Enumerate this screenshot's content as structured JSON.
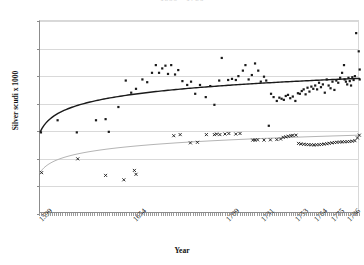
{
  "chart_data": {
    "type": "scatter",
    "title": "1599 - 1786",
    "xlabel": "Year",
    "ylabel": "Silver scudi x 1000",
    "ylim": [
      0,
      3500
    ],
    "ytick_labels": [
      "0",
      "500",
      "1,000",
      "1,500",
      "2,000",
      "2,500",
      "3,000",
      "3,500"
    ],
    "ytick_values": [
      0,
      500,
      1000,
      1500,
      2000,
      2500,
      3000,
      3500
    ],
    "xtick_labels": [
      "1599",
      "1654",
      "1709",
      "1731",
      "1753",
      "1764",
      "1775",
      "1786"
    ],
    "xtick_positions": [
      0,
      0.295,
      0.585,
      0.695,
      0.8,
      0.858,
      0.912,
      0.963
    ],
    "grid": "horizontal",
    "legend": "none",
    "series": [
      {
        "name": "upper-series",
        "marker": "square",
        "color": "#1a1a1a",
        "trend": "logarithmic",
        "trend_color": "#1a1a1a",
        "trend_start_value": 1480,
        "trend_end_value": 2460,
        "points": [
          [
            0.003,
            1480
          ],
          [
            0.055,
            1700
          ],
          [
            0.115,
            1480
          ],
          [
            0.175,
            1700
          ],
          [
            0.205,
            1720
          ],
          [
            0.215,
            1490
          ],
          [
            0.245,
            1940
          ],
          [
            0.268,
            2420
          ],
          [
            0.285,
            2200
          ],
          [
            0.3,
            2270
          ],
          [
            0.32,
            2440
          ],
          [
            0.335,
            2390
          ],
          [
            0.35,
            2560
          ],
          [
            0.362,
            2700
          ],
          [
            0.372,
            2560
          ],
          [
            0.382,
            2640
          ],
          [
            0.392,
            2690
          ],
          [
            0.4,
            2540
          ],
          [
            0.41,
            2700
          ],
          [
            0.422,
            2530
          ],
          [
            0.432,
            2610
          ],
          [
            0.445,
            2410
          ],
          [
            0.46,
            2340
          ],
          [
            0.472,
            2400
          ],
          [
            0.485,
            2180
          ],
          [
            0.5,
            2340
          ],
          [
            0.518,
            2120
          ],
          [
            0.532,
            2320
          ],
          [
            0.545,
            1980
          ],
          [
            0.56,
            2420
          ],
          [
            0.568,
            2830
          ],
          [
            0.588,
            2430
          ],
          [
            0.6,
            2450
          ],
          [
            0.612,
            2430
          ],
          [
            0.62,
            2500
          ],
          [
            0.634,
            2600
          ],
          [
            0.642,
            2700
          ],
          [
            0.652,
            2440
          ],
          [
            0.662,
            2520
          ],
          [
            0.672,
            2730
          ],
          [
            0.682,
            2600
          ],
          [
            0.69,
            2400
          ],
          [
            0.7,
            2490
          ],
          [
            0.707,
            2420
          ],
          [
            0.715,
            1600
          ],
          [
            0.722,
            2180
          ],
          [
            0.73,
            2120
          ],
          [
            0.74,
            2050
          ],
          [
            0.748,
            2110
          ],
          [
            0.755,
            2090
          ],
          [
            0.762,
            2070
          ],
          [
            0.768,
            2140
          ],
          [
            0.775,
            2160
          ],
          [
            0.782,
            2100
          ],
          [
            0.79,
            2130
          ],
          [
            0.798,
            2050
          ],
          [
            0.806,
            2190
          ],
          [
            0.812,
            2180
          ],
          [
            0.818,
            2230
          ],
          [
            0.824,
            2260
          ],
          [
            0.83,
            2170
          ],
          [
            0.836,
            2290
          ],
          [
            0.842,
            2220
          ],
          [
            0.848,
            2310
          ],
          [
            0.854,
            2270
          ],
          [
            0.86,
            2330
          ],
          [
            0.866,
            2260
          ],
          [
            0.872,
            2380
          ],
          [
            0.878,
            2300
          ],
          [
            0.884,
            2350
          ],
          [
            0.89,
            2200
          ],
          [
            0.896,
            2440
          ],
          [
            0.902,
            2330
          ],
          [
            0.908,
            2280
          ],
          [
            0.914,
            2400
          ],
          [
            0.92,
            2250
          ],
          [
            0.926,
            2420
          ],
          [
            0.932,
            2380
          ],
          [
            0.938,
            2470
          ],
          [
            0.944,
            2560
          ],
          [
            0.95,
            2700
          ],
          [
            0.952,
            2440
          ],
          [
            0.956,
            2400
          ],
          [
            0.96,
            2350
          ],
          [
            0.964,
            2470
          ],
          [
            0.968,
            2410
          ],
          [
            0.972,
            2330
          ],
          [
            0.976,
            2480
          ],
          [
            0.98,
            2430
          ],
          [
            0.984,
            2500
          ],
          [
            0.988,
            3280
          ],
          [
            0.996,
            2950
          ],
          [
            0.999,
            2620
          ],
          [
            0.999,
            2440
          ]
        ]
      },
      {
        "name": "lower-series",
        "marker": "x",
        "color": "#1a1a1a",
        "trend": "logarithmic",
        "trend_color": "#b5b5b5",
        "trend_start_value": 750,
        "trend_end_value": 1430,
        "points": [
          [
            0.005,
            750
          ],
          [
            0.118,
            1000
          ],
          [
            0.205,
            700
          ],
          [
            0.262,
            620
          ],
          [
            0.295,
            790
          ],
          [
            0.3,
            720
          ],
          [
            0.418,
            1420
          ],
          [
            0.438,
            1440
          ],
          [
            0.47,
            1290
          ],
          [
            0.492,
            1300
          ],
          [
            0.52,
            1440
          ],
          [
            0.545,
            1440
          ],
          [
            0.552,
            1450
          ],
          [
            0.562,
            1440
          ],
          [
            0.578,
            1450
          ],
          [
            0.59,
            1460
          ],
          [
            0.612,
            1450
          ],
          [
            0.625,
            1460
          ],
          [
            0.665,
            1340
          ],
          [
            0.672,
            1340
          ],
          [
            0.68,
            1345
          ],
          [
            0.7,
            1340
          ],
          [
            0.72,
            1345
          ],
          [
            0.74,
            1350
          ],
          [
            0.752,
            1360
          ],
          [
            0.76,
            1390
          ],
          [
            0.768,
            1400
          ],
          [
            0.776,
            1410
          ],
          [
            0.784,
            1420
          ],
          [
            0.79,
            1425
          ],
          [
            0.8,
            1430
          ],
          [
            0.808,
            1280
          ],
          [
            0.816,
            1270
          ],
          [
            0.824,
            1265
          ],
          [
            0.832,
            1260
          ],
          [
            0.84,
            1258
          ],
          [
            0.848,
            1255
          ],
          [
            0.856,
            1252
          ],
          [
            0.864,
            1255
          ],
          [
            0.872,
            1258
          ],
          [
            0.88,
            1262
          ],
          [
            0.888,
            1268
          ],
          [
            0.896,
            1275
          ],
          [
            0.904,
            1282
          ],
          [
            0.912,
            1290
          ],
          [
            0.92,
            1296
          ],
          [
            0.928,
            1300
          ],
          [
            0.936,
            1305
          ],
          [
            0.944,
            1308
          ],
          [
            0.952,
            1310
          ],
          [
            0.96,
            1312
          ],
          [
            0.968,
            1315
          ],
          [
            0.976,
            1320
          ],
          [
            0.984,
            1330
          ],
          [
            0.992,
            1380
          ],
          [
            0.998,
            1430
          ]
        ]
      }
    ]
  }
}
